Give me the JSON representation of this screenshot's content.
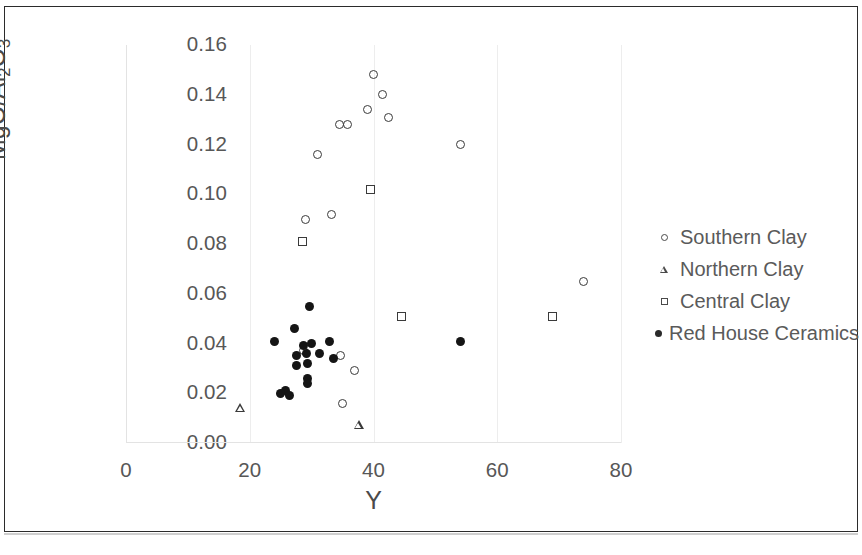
{
  "chart_data": {
    "type": "scatter",
    "title": "",
    "xlabel": "Y",
    "ylabel": "MgO/Al2O3",
    "ylabel_parts": {
      "prefix": "MgO/Al",
      "sub1": "2",
      "mid": "O",
      "sub2": "3"
    },
    "xlim": [
      0,
      80
    ],
    "ylim": [
      0.0,
      0.16
    ],
    "xticks": [
      "0",
      "20",
      "40",
      "60",
      "80"
    ],
    "xtick_values": [
      0,
      20,
      40,
      60,
      80
    ],
    "yticks": [
      "0.00",
      "0.02",
      "0.04",
      "0.06",
      "0.08",
      "0.10",
      "0.12",
      "0.14",
      "0.16"
    ],
    "ytick_values": [
      0.0,
      0.02,
      0.04,
      0.06,
      0.08,
      0.1,
      0.12,
      0.14,
      0.16
    ],
    "grid": "vertical",
    "legend_position": "right",
    "colors": {
      "marker_outline": "#3a3a3a",
      "marker_fill": "#151515",
      "text": "#575757",
      "gridline": "#ededed",
      "frame": "#2b2b2b"
    },
    "series": [
      {
        "name": "Southern Clay",
        "marker": "open-circle",
        "points": [
          [
            40.0,
            0.148
          ],
          [
            41.5,
            0.14
          ],
          [
            39.0,
            0.134
          ],
          [
            42.5,
            0.131
          ],
          [
            34.5,
            0.128
          ],
          [
            35.8,
            0.128
          ],
          [
            31.0,
            0.116
          ],
          [
            54.0,
            0.12
          ],
          [
            29.0,
            0.09
          ],
          [
            33.2,
            0.092
          ],
          [
            74.0,
            0.065
          ],
          [
            34.6,
            0.035
          ],
          [
            36.9,
            0.029
          ],
          [
            28.7,
            0.037
          ],
          [
            35.0,
            0.016
          ]
        ]
      },
      {
        "name": "Northern Clay",
        "marker": "open-triangle",
        "points": [
          [
            18.5,
            0.014
          ],
          [
            37.7,
            0.011
          ]
        ]
      },
      {
        "name": "Central Clay",
        "marker": "open-square",
        "points": [
          [
            39.5,
            0.102
          ],
          [
            28.5,
            0.081
          ],
          [
            44.5,
            0.051
          ],
          [
            69.0,
            0.051
          ]
        ]
      },
      {
        "name": "Red House Ceramics",
        "marker": "filled-circle",
        "points": [
          [
            29.7,
            0.055
          ],
          [
            27.3,
            0.046
          ],
          [
            24.0,
            0.041
          ],
          [
            54.0,
            0.041
          ],
          [
            30.0,
            0.04
          ],
          [
            32.9,
            0.041
          ],
          [
            28.7,
            0.039
          ],
          [
            29.2,
            0.036
          ],
          [
            27.5,
            0.035
          ],
          [
            31.2,
            0.036
          ],
          [
            33.5,
            0.034
          ],
          [
            29.4,
            0.032
          ],
          [
            27.6,
            0.031
          ],
          [
            29.4,
            0.026
          ],
          [
            29.4,
            0.024
          ],
          [
            25.8,
            0.021
          ],
          [
            25.0,
            0.02
          ],
          [
            26.5,
            0.019
          ]
        ]
      }
    ]
  },
  "legend": {
    "items": [
      {
        "label": "Southern Clay",
        "marker": "open-circle"
      },
      {
        "label": "Northern Clay",
        "marker": "open-triangle"
      },
      {
        "label": "Central Clay",
        "marker": "open-square"
      },
      {
        "label": "Red House Ceramics",
        "marker": "filled-circle"
      }
    ]
  }
}
